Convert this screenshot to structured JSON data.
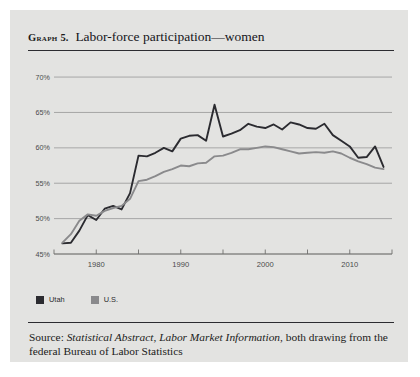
{
  "card": {
    "graph_label": "Graph",
    "graph_number": "5.",
    "title": "Labor-force participation—women"
  },
  "legend": {
    "items": [
      {
        "label": "Utah",
        "color": "#2b2b30"
      },
      {
        "label": "U.S.",
        "color": "#8a8a8c"
      }
    ]
  },
  "source": {
    "prefix": "Source: ",
    "italic_1": "Statistical Abstract",
    "sep_1": ", ",
    "italic_2": "Labor Market Information",
    "suffix": ", both drawing from the federal Bureau of Labor Statistics"
  },
  "chart_data": {
    "type": "line",
    "title": "Labor-force participation—women",
    "xlabel": "",
    "ylabel": "",
    "xlim": [
      1975,
      2015
    ],
    "ylim": [
      45,
      71
    ],
    "ytick_values": [
      45,
      50,
      55,
      60,
      65,
      70
    ],
    "ytick_labels": [
      "45%",
      "50%",
      "55%",
      "60%",
      "65%",
      "70%"
    ],
    "xtick_values": [
      1980,
      1990,
      2000,
      2010
    ],
    "xtick_labels": [
      "1980",
      "1990",
      "2000",
      "2010"
    ],
    "xminor_ticks": [
      1975,
      1985,
      1995,
      2005,
      2015
    ],
    "grid": true,
    "legend_position": "below-left",
    "x": [
      1976,
      1977,
      1978,
      1979,
      1980,
      1981,
      1982,
      1983,
      1984,
      1985,
      1986,
      1987,
      1988,
      1989,
      1990,
      1991,
      1992,
      1993,
      1994,
      1995,
      1996,
      1997,
      1998,
      1999,
      2000,
      2001,
      2002,
      2003,
      2004,
      2005,
      2006,
      2007,
      2008,
      2009,
      2010,
      2011,
      2012,
      2013,
      2014
    ],
    "series": [
      {
        "name": "Utah",
        "color": "#2b2b30",
        "values": [
          46.5,
          46.6,
          48.3,
          50.5,
          49.8,
          51.4,
          51.8,
          51.3,
          53.6,
          58.9,
          58.8,
          59.3,
          60.0,
          59.5,
          61.3,
          61.7,
          61.8,
          61.0,
          66.1,
          61.6,
          62.0,
          62.5,
          63.4,
          63.0,
          62.8,
          63.3,
          62.6,
          63.6,
          63.3,
          62.8,
          62.7,
          63.4,
          61.8,
          61.0,
          60.2,
          58.6,
          58.7,
          60.2,
          57.3
        ]
      },
      {
        "name": "U.S.",
        "color": "#8a8a8c",
        "values": [
          46.6,
          47.8,
          49.7,
          50.6,
          50.4,
          51.1,
          51.5,
          51.8,
          52.8,
          55.3,
          55.5,
          56.0,
          56.6,
          57.0,
          57.5,
          57.4,
          57.8,
          57.9,
          58.8,
          58.9,
          59.3,
          59.8,
          59.8,
          60.0,
          60.2,
          60.1,
          59.8,
          59.5,
          59.2,
          59.3,
          59.4,
          59.3,
          59.5,
          59.2,
          58.6,
          58.1,
          57.7,
          57.2,
          57.0
        ]
      }
    ]
  }
}
